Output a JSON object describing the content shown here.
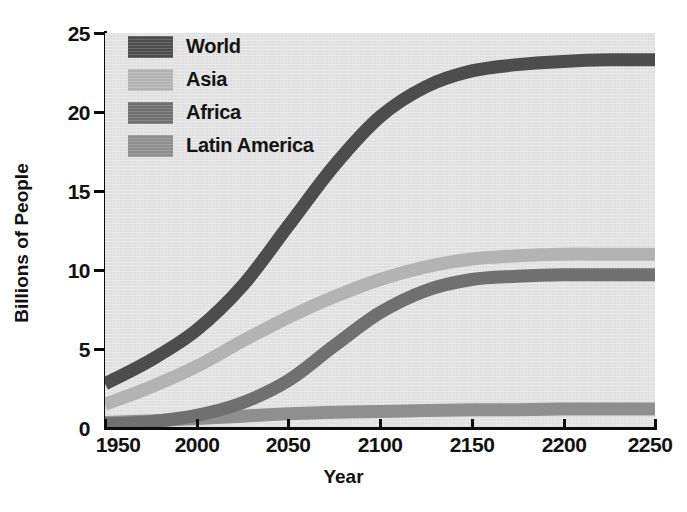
{
  "figure": {
    "axis_titles": {
      "x": "Year",
      "y": "Billions of People"
    },
    "page_background": "#ffffff",
    "plot_background": "#e2e2e2",
    "axis_color": "#0b0b0b"
  },
  "legend": {
    "position": "inside-top-left",
    "entries": [
      {
        "label": "World",
        "color": "#4d4d4d"
      },
      {
        "label": "Asia",
        "color": "#b3b3b3"
      },
      {
        "label": "Africa",
        "color": "#707070"
      },
      {
        "label": "Latin America",
        "color": "#8f8f8f"
      }
    ]
  },
  "axes": {
    "y_ticks": [
      "25",
      "20",
      "15",
      "10",
      "5",
      "0"
    ],
    "x_ticks": [
      "1950",
      "2000",
      "2050",
      "2100",
      "2150",
      "2200",
      "2250"
    ]
  },
  "chart_data": {
    "type": "line",
    "title": "",
    "subtitle": "",
    "xlabel": "Year",
    "ylabel": "Billions of People",
    "xlim": [
      1950,
      2250
    ],
    "ylim": [
      0,
      25
    ],
    "xticks": [
      1950,
      2000,
      2050,
      2100,
      2150,
      2200,
      2250
    ],
    "yticks": [
      0,
      5,
      10,
      15,
      20,
      25
    ],
    "grid": false,
    "legend_position": "upper left (inside axes)",
    "line_style": "thick smooth bands",
    "x": [
      1950,
      1975,
      2000,
      2025,
      2050,
      2075,
      2100,
      2125,
      2150,
      2175,
      2200,
      2225,
      2250
    ],
    "series": [
      {
        "name": "World",
        "color": "#4d4d4d",
        "values": [
          2.8,
          4.3,
          6.2,
          9.0,
          12.8,
          16.6,
          19.7,
          21.6,
          22.6,
          23.0,
          23.2,
          23.3,
          23.3
        ]
      },
      {
        "name": "Asia",
        "color": "#b3b3b3",
        "values": [
          1.5,
          2.6,
          3.9,
          5.5,
          7.0,
          8.3,
          9.4,
          10.2,
          10.7,
          10.9,
          11.0,
          11.0,
          11.0
        ]
      },
      {
        "name": "Africa",
        "color": "#707070",
        "values": [
          0.25,
          0.4,
          0.8,
          1.6,
          3.0,
          5.2,
          7.3,
          8.7,
          9.4,
          9.6,
          9.7,
          9.7,
          9.7
        ]
      },
      {
        "name": "Latin America",
        "color": "#8f8f8f",
        "values": [
          0.35,
          0.45,
          0.6,
          0.75,
          0.9,
          1.0,
          1.05,
          1.1,
          1.15,
          1.15,
          1.2,
          1.2,
          1.2
        ]
      }
    ]
  }
}
